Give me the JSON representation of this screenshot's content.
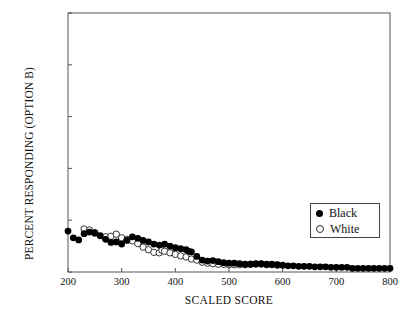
{
  "chart_data": {
    "type": "scatter",
    "title": "",
    "xlabel": "SCALED SCORE",
    "ylabel": "PERCENT RESPONDING (OPTION B)",
    "xlim": [
      200,
      800
    ],
    "ylim": [
      0,
      100
    ],
    "xticks": [
      200,
      300,
      400,
      500,
      600,
      700,
      800
    ],
    "yticks": [
      0,
      20,
      40,
      60,
      80,
      100
    ],
    "grid": false,
    "legend_position": "center-right",
    "legend": [
      "Black",
      "White"
    ],
    "series": [
      {
        "name": "Black",
        "marker": "filled-circle",
        "color": "#000000",
        "points": [
          [
            200,
            15.8
          ],
          [
            210,
            13.2
          ],
          [
            220,
            12.4
          ],
          [
            230,
            14.8
          ],
          [
            240,
            15.4
          ],
          [
            250,
            15.0
          ],
          [
            260,
            14.0
          ],
          [
            270,
            12.6
          ],
          [
            280,
            11.4
          ],
          [
            290,
            11.6
          ],
          [
            300,
            10.8
          ],
          [
            310,
            12.2
          ],
          [
            320,
            13.6
          ],
          [
            330,
            13.0
          ],
          [
            340,
            12.2
          ],
          [
            350,
            11.6
          ],
          [
            360,
            10.8
          ],
          [
            370,
            10.4
          ],
          [
            380,
            10.8
          ],
          [
            390,
            10.0
          ],
          [
            400,
            9.4
          ],
          [
            410,
            9.0
          ],
          [
            420,
            8.6
          ],
          [
            425,
            8.0
          ],
          [
            430,
            7.8
          ],
          [
            440,
            6.0
          ],
          [
            450,
            4.6
          ],
          [
            460,
            4.2
          ],
          [
            470,
            4.4
          ],
          [
            480,
            4.0
          ],
          [
            490,
            3.6
          ],
          [
            500,
            3.4
          ],
          [
            510,
            3.4
          ],
          [
            520,
            3.2
          ],
          [
            530,
            3.0
          ],
          [
            540,
            3.0
          ],
          [
            550,
            3.2
          ],
          [
            560,
            3.2
          ],
          [
            570,
            3.0
          ],
          [
            580,
            3.0
          ],
          [
            590,
            2.8
          ],
          [
            600,
            2.6
          ],
          [
            610,
            2.4
          ],
          [
            620,
            2.4
          ],
          [
            630,
            2.2
          ],
          [
            640,
            2.2
          ],
          [
            650,
            2.2
          ],
          [
            660,
            2.0
          ],
          [
            670,
            2.0
          ],
          [
            680,
            2.0
          ],
          [
            690,
            1.8
          ],
          [
            700,
            1.8
          ],
          [
            710,
            1.8
          ],
          [
            720,
            1.8
          ],
          [
            730,
            1.4
          ],
          [
            740,
            1.4
          ],
          [
            750,
            1.4
          ],
          [
            760,
            1.4
          ],
          [
            770,
            1.4
          ],
          [
            780,
            1.4
          ],
          [
            790,
            1.4
          ],
          [
            800,
            1.4
          ]
        ]
      },
      {
        "name": "White",
        "marker": "open-circle",
        "color": "#ffffff",
        "points": [
          [
            230,
            16.6
          ],
          [
            240,
            16.2
          ],
          [
            250,
            15.2
          ],
          [
            270,
            13.6
          ],
          [
            280,
            13.8
          ],
          [
            290,
            14.6
          ],
          [
            300,
            13.2
          ],
          [
            310,
            12.6
          ],
          [
            320,
            12.0
          ],
          [
            330,
            11.0
          ],
          [
            340,
            9.6
          ],
          [
            350,
            8.6
          ],
          [
            360,
            7.6
          ],
          [
            370,
            7.4
          ],
          [
            375,
            8.4
          ],
          [
            380,
            8.0
          ],
          [
            390,
            7.4
          ],
          [
            400,
            6.8
          ],
          [
            410,
            6.2
          ],
          [
            420,
            5.8
          ],
          [
            430,
            5.0
          ],
          [
            440,
            4.6
          ],
          [
            450,
            3.8
          ],
          [
            460,
            3.4
          ],
          [
            470,
            3.2
          ],
          [
            480,
            3.0
          ],
          [
            490,
            3.0
          ],
          [
            500,
            2.8
          ],
          [
            510,
            2.8
          ],
          [
            520,
            2.8
          ],
          [
            530,
            2.8
          ],
          [
            540,
            3.0
          ],
          [
            550,
            3.0
          ],
          [
            560,
            3.0
          ],
          [
            570,
            2.8
          ],
          [
            580,
            2.8
          ],
          [
            590,
            2.6
          ]
        ]
      }
    ]
  },
  "axes": {
    "ytick_labels": [
      "0",
      "20",
      "40",
      "60",
      "80",
      "100"
    ],
    "xtick_labels": [
      "200",
      "300",
      "400",
      "500",
      "600",
      "700",
      "800"
    ]
  }
}
